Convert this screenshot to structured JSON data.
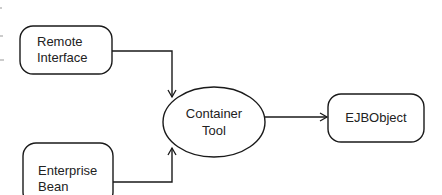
{
  "diagram": {
    "nodes": {
      "remote_interface": {
        "line1": "Remote",
        "line2": "Interface",
        "shape": "rounded-rect"
      },
      "enterprise_bean": {
        "line1": "Enterprise",
        "line2": "Bean",
        "shape": "rounded-rect"
      },
      "container_tool": {
        "line1": "Container",
        "line2": "Tool",
        "shape": "ellipse"
      },
      "ejbobject": {
        "line1": "EJBObject",
        "shape": "rounded-rect"
      }
    },
    "edges": [
      {
        "from": "remote_interface",
        "to": "container_tool"
      },
      {
        "from": "enterprise_bean",
        "to": "container_tool"
      },
      {
        "from": "container_tool",
        "to": "ejbobject"
      }
    ],
    "colors": {
      "stroke": "#1a1a1a",
      "background": "#ffffff"
    }
  }
}
